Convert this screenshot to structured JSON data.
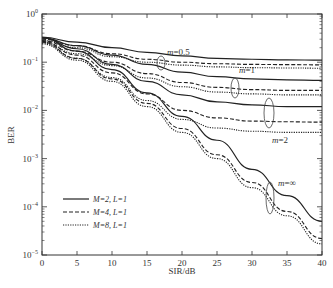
{
  "chart_data": {
    "type": "line",
    "title": "",
    "xlabel": "SIR/dB",
    "ylabel": "BER",
    "xlim": [
      0,
      40
    ],
    "ylim": [
      1e-05,
      1
    ],
    "yscale": "log",
    "xticks": [
      0,
      5,
      10,
      15,
      20,
      25,
      30,
      35,
      40
    ],
    "yticks": [
      "10^0",
      "10^-1",
      "10^-2",
      "10^-3",
      "10^-4",
      "10^-5"
    ],
    "grid": false,
    "legend_position": "lower left",
    "legend": [
      {
        "label": "M=2, L=1",
        "style": "solid"
      },
      {
        "label": "M=4, L=1",
        "style": "dashed"
      },
      {
        "label": "M=8, L=1",
        "style": "dotted"
      }
    ],
    "annotations": [
      "m=0.5",
      "m=1",
      "m=2",
      "m=∞"
    ],
    "x": [
      0,
      5,
      10,
      15,
      20,
      25,
      30,
      35,
      40
    ],
    "series": [
      {
        "name": "M=2, L=1, m=0.5",
        "style": "solid",
        "values": [
          0.33,
          0.26,
          0.2,
          0.16,
          0.135,
          0.12,
          0.115,
          0.112,
          0.11
        ]
      },
      {
        "name": "M=4, L=1, m=0.5",
        "style": "dashed",
        "values": [
          0.3,
          0.22,
          0.15,
          0.115,
          0.1,
          0.093,
          0.09,
          0.089,
          0.088
        ]
      },
      {
        "name": "M=8, L=1, m=0.5",
        "style": "dotted",
        "values": [
          0.28,
          0.2,
          0.13,
          0.1,
          0.087,
          0.08,
          0.077,
          0.076,
          0.075
        ]
      },
      {
        "name": "M=2, L=1, m=1",
        "style": "solid",
        "values": [
          0.32,
          0.22,
          0.14,
          0.09,
          0.062,
          0.05,
          0.045,
          0.043,
          0.042
        ]
      },
      {
        "name": "M=4, L=1, m=1",
        "style": "dashed",
        "values": [
          0.28,
          0.17,
          0.1,
          0.058,
          0.038,
          0.03,
          0.027,
          0.026,
          0.026
        ]
      },
      {
        "name": "M=8, L=1, m=1",
        "style": "dotted",
        "values": [
          0.26,
          0.15,
          0.085,
          0.047,
          0.031,
          0.024,
          0.022,
          0.021,
          0.021
        ]
      },
      {
        "name": "M=2, L=1, m=2",
        "style": "solid",
        "values": [
          0.32,
          0.19,
          0.09,
          0.04,
          0.021,
          0.015,
          0.013,
          0.012,
          0.012
        ]
      },
      {
        "name": "M=4, L=1, m=2",
        "style": "dashed",
        "values": [
          0.27,
          0.14,
          0.06,
          0.022,
          0.01,
          0.007,
          0.006,
          0.0058,
          0.0057
        ]
      },
      {
        "name": "M=8, L=1, m=2",
        "style": "dotted",
        "values": [
          0.25,
          0.12,
          0.048,
          0.016,
          0.0065,
          0.0043,
          0.0037,
          0.0035,
          0.0035
        ]
      },
      {
        "name": "M=2, L=1, m=∞",
        "style": "solid",
        "values": [
          0.32,
          0.17,
          0.07,
          0.023,
          0.0075,
          0.0024,
          0.0006,
          0.00017,
          5e-05
        ]
      },
      {
        "name": "M=4, L=1, m=∞",
        "style": "dashed",
        "values": [
          0.26,
          0.12,
          0.045,
          0.014,
          0.0042,
          0.0012,
          0.00032,
          8e-05,
          2.2e-05
        ]
      },
      {
        "name": "M=8, L=1, m=∞",
        "style": "dotted",
        "values": [
          0.24,
          0.11,
          0.04,
          0.012,
          0.0035,
          0.001,
          0.00025,
          6.5e-05,
          1.7e-05
        ]
      }
    ]
  }
}
